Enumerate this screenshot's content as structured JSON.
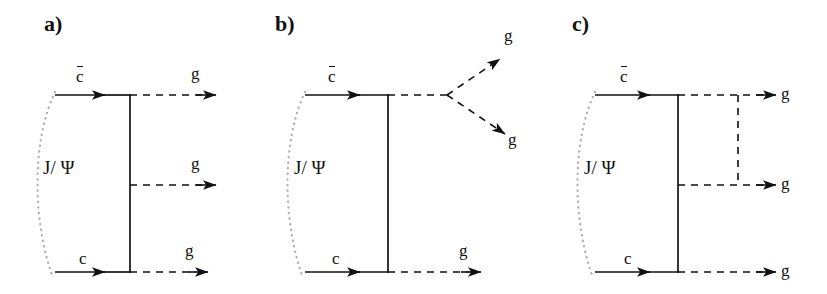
{
  "figure": {
    "background_color": "#ffffff",
    "line_color": "#111111",
    "arc_color": "#b3b3b3",
    "caption_note": "Feynman diagrams for J/psi decay into three gluons"
  },
  "panels": [
    {
      "id": "a",
      "label": "a)",
      "bound_state_label": "J/ Ψ",
      "antiquark_label": "c",
      "antiquark_bar": true,
      "quark_label": "c",
      "gluon_labels": [
        "g",
        "g",
        "g"
      ],
      "topology": "three-horizontal-gluons",
      "gluon_count": 3
    },
    {
      "id": "b",
      "label": "b)",
      "bound_state_label": "J/ Ψ",
      "antiquark_label": "c",
      "antiquark_bar": true,
      "quark_label": "c",
      "gluon_labels": [
        "g",
        "g",
        "g"
      ],
      "topology": "gluon-splitting-vertex",
      "gluon_count": 3
    },
    {
      "id": "c",
      "label": "c)",
      "bound_state_label": "J/ Ψ",
      "antiquark_label": "c",
      "antiquark_bar": true,
      "quark_label": "c",
      "gluon_labels": [
        "g",
        "g",
        "g"
      ],
      "topology": "three-gluon-with-exchange-rung",
      "gluon_count": 3
    }
  ]
}
